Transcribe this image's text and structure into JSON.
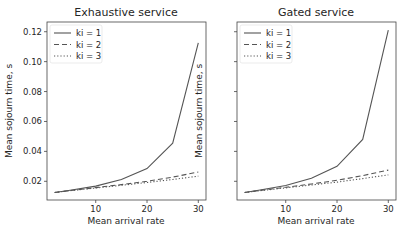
{
  "chart_data": [
    {
      "type": "line",
      "title": "Exhaustive service",
      "xlabel": "Mean arrival rate",
      "ylabel": "Mean sojourn time, s",
      "x": [
        2,
        5,
        10,
        15,
        20,
        25,
        30
      ],
      "xticks": [
        10,
        20,
        30
      ],
      "yticks": [
        0.02,
        0.04,
        0.06,
        0.08,
        0.1,
        0.12
      ],
      "ytick_labels": [
        "0.02",
        "0.04",
        "0.06",
        "0.08",
        "0.10",
        "0.12"
      ],
      "xlim": [
        0.5,
        31.5
      ],
      "ylim": [
        0.0075,
        0.1265
      ],
      "legend_position": "upper left",
      "grid": false,
      "series": [
        {
          "name": "ki = 1",
          "style": "solid",
          "values": [
            0.0125,
            0.014,
            0.0168,
            0.0212,
            0.0285,
            0.0455,
            0.1125
          ]
        },
        {
          "name": "ki = 2",
          "style": "dashed",
          "values": [
            0.0125,
            0.0138,
            0.0158,
            0.0178,
            0.02,
            0.0228,
            0.0262
          ]
        },
        {
          "name": "ki = 3",
          "style": "dotted",
          "values": [
            0.0125,
            0.0137,
            0.0155,
            0.0173,
            0.0192,
            0.0212,
            0.0235
          ]
        }
      ]
    },
    {
      "type": "line",
      "title": "Gated service",
      "xlabel": "Mean arrival rate",
      "ylabel": "Mean sojourn time, s",
      "x": [
        2,
        5,
        10,
        15,
        20,
        25,
        30
      ],
      "xticks": [
        10,
        20,
        30
      ],
      "yticks": [
        0.02,
        0.04,
        0.06,
        0.08,
        0.1,
        0.12
      ],
      "ytick_labels": [
        "",
        "",
        "",
        "",
        "",
        ""
      ],
      "xlim": [
        0.5,
        31.5
      ],
      "ylim": [
        0.0075,
        0.1265
      ],
      "legend_position": "upper left",
      "grid": false,
      "series": [
        {
          "name": "ki = 1",
          "style": "solid",
          "values": [
            0.0125,
            0.0142,
            0.0172,
            0.022,
            0.03,
            0.048,
            0.121
          ]
        },
        {
          "name": "ki = 2",
          "style": "dashed",
          "values": [
            0.0125,
            0.0139,
            0.016,
            0.0182,
            0.0207,
            0.0238,
            0.0275
          ]
        },
        {
          "name": "ki = 3",
          "style": "dotted",
          "values": [
            0.0125,
            0.0137,
            0.0156,
            0.0175,
            0.0195,
            0.0218,
            0.0243
          ]
        }
      ]
    }
  ],
  "colors": {
    "line": "#555555",
    "axis": "#444444",
    "text": "#262626"
  }
}
